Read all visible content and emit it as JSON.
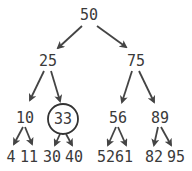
{
  "diagram": {
    "type": "binary-search-tree",
    "highlighted_node": "33",
    "colors": {
      "text": "#3a3a3a",
      "edge": "#444444",
      "background": "#ffffff"
    },
    "nodes": [
      {
        "id": "n50",
        "label": "50",
        "x": 89,
        "y": 15
      },
      {
        "id": "n25",
        "label": "25",
        "x": 48,
        "y": 61
      },
      {
        "id": "n75",
        "label": "75",
        "x": 136,
        "y": 61
      },
      {
        "id": "n10",
        "label": "10",
        "x": 25,
        "y": 118
      },
      {
        "id": "n33",
        "label": "33",
        "x": 63,
        "y": 119,
        "circled": true
      },
      {
        "id": "n56",
        "label": "56",
        "x": 118,
        "y": 118
      },
      {
        "id": "n89",
        "label": "89",
        "x": 160,
        "y": 118
      },
      {
        "id": "n4",
        "label": "4",
        "x": 11,
        "y": 157
      },
      {
        "id": "n11",
        "label": "11",
        "x": 29,
        "y": 157
      },
      {
        "id": "n30",
        "label": "30",
        "x": 52,
        "y": 157
      },
      {
        "id": "n40",
        "label": "40",
        "x": 74,
        "y": 157
      },
      {
        "id": "n52",
        "label": "52",
        "x": 106,
        "y": 157
      },
      {
        "id": "n61",
        "label": "61",
        "x": 124,
        "y": 157
      },
      {
        "id": "n82",
        "label": "82",
        "x": 154,
        "y": 157
      },
      {
        "id": "n95",
        "label": "95",
        "x": 176,
        "y": 157
      }
    ],
    "edges": [
      [
        "50",
        "25"
      ],
      [
        "50",
        "75"
      ],
      [
        "25",
        "10"
      ],
      [
        "25",
        "33"
      ],
      [
        "75",
        "56"
      ],
      [
        "75",
        "89"
      ],
      [
        "10",
        "4"
      ],
      [
        "10",
        "11"
      ],
      [
        "33",
        "30"
      ],
      [
        "33",
        "40"
      ],
      [
        "56",
        "52"
      ],
      [
        "56",
        "61"
      ],
      [
        "89",
        "82"
      ],
      [
        "89",
        "95"
      ]
    ]
  }
}
